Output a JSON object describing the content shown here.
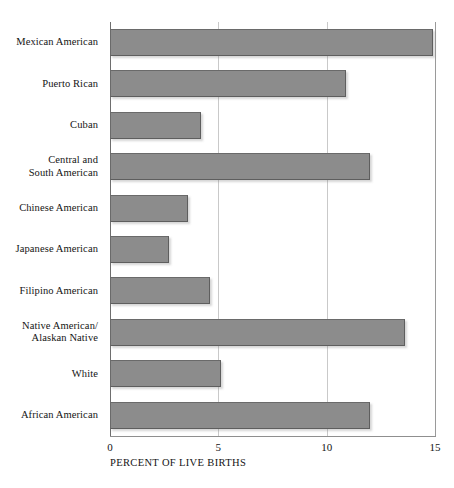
{
  "chart_data": {
    "type": "bar",
    "orientation": "horizontal",
    "title": "",
    "xlabel": "PERCENT OF LIVE BIRTHS",
    "ylabel": "",
    "xlim": [
      0,
      15
    ],
    "xticks": [
      0,
      5,
      10,
      15
    ],
    "xtick_labels": [
      "0",
      "5",
      "10",
      "15"
    ],
    "grid": "vertical",
    "legend": "none",
    "bar_color": "#8c8c8c",
    "categories": [
      "Mexican American",
      "Puerto Rican",
      "Cuban",
      "Central and South American",
      "Chinese American",
      "Japanese American",
      "Filipino American",
      "Native American/ Alaskan Native",
      "White",
      "African American"
    ],
    "category_label_lines": [
      [
        "Mexican American"
      ],
      [
        "Puerto Rican"
      ],
      [
        "Cuban"
      ],
      [
        "Central and",
        "South American"
      ],
      [
        "Chinese American"
      ],
      [
        "Japanese American"
      ],
      [
        "Filipino American"
      ],
      [
        "Native American/",
        "Alaskan Native"
      ],
      [
        "White"
      ],
      [
        "African American"
      ]
    ],
    "values": [
      14.9,
      10.9,
      4.2,
      12.0,
      3.6,
      2.7,
      4.6,
      13.6,
      5.1,
      12.0
    ]
  }
}
